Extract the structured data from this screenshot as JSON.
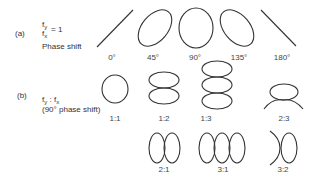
{
  "part_a": {
    "label": "(a)",
    "ratio_num": "f",
    "ratio_num_sub": "y",
    "ratio_den": "f",
    "ratio_den_sub": "x",
    "ratio_eq": "= 1",
    "caption": "Phase shift",
    "figures": [
      {
        "id": "0deg",
        "label": "0°",
        "shape": "diagonal-line-rising"
      },
      {
        "id": "45deg",
        "label": "45°",
        "shape": "tilted-ellipse-right"
      },
      {
        "id": "90deg",
        "label": "90°",
        "shape": "upright-ellipse"
      },
      {
        "id": "135deg",
        "label": "135°",
        "shape": "tilted-ellipse-left"
      },
      {
        "id": "180deg",
        "label": "180°",
        "shape": "diagonal-line-falling"
      }
    ]
  },
  "part_b": {
    "label": "(b)",
    "ratio_text_a": "f",
    "ratio_sub_a": "y",
    "ratio_colon": " : f",
    "ratio_sub_b": "x",
    "caption": "(90° phase shift)",
    "figures": [
      {
        "id": "1-1",
        "label": "1:1",
        "shape": "circle"
      },
      {
        "id": "1-2",
        "label": "1:2",
        "shape": "two-stacked-loops"
      },
      {
        "id": "1-3",
        "label": "1:3",
        "shape": "three-stacked-loops"
      },
      {
        "id": "2-3",
        "label": "2:3",
        "shape": "loop-with-open-arcs-below"
      },
      {
        "id": "2-1",
        "label": "2:1",
        "shape": "two-side-by-side-loops"
      },
      {
        "id": "3-1",
        "label": "3:1",
        "shape": "three-side-by-side-loops"
      },
      {
        "id": "3-2",
        "label": "3:2",
        "shape": "loop-with-open-arcs-left"
      }
    ]
  }
}
